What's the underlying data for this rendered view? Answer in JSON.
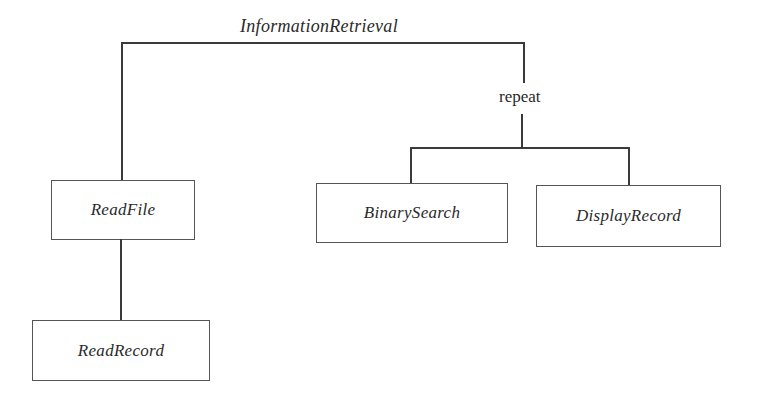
{
  "diagram": {
    "type": "structure-chart",
    "root": {
      "label": "InformationRetrieval",
      "children": [
        {
          "label": "ReadFile",
          "children": [
            {
              "label": "ReadRecord"
            }
          ]
        },
        {
          "construct": "repeat",
          "children": [
            {
              "label": "BinarySearch"
            },
            {
              "label": "DisplayRecord"
            }
          ]
        }
      ]
    },
    "nodes": {
      "root": "InformationRetrieval",
      "read_file": "ReadFile",
      "read_record": "ReadRecord",
      "repeat": "repeat",
      "binary_search": "BinarySearch",
      "display_record": "DisplayRecord"
    },
    "colors": {
      "line": "#3a3a3a",
      "box_border": "#555555",
      "text": "#2a2a2a",
      "background": "#ffffff"
    }
  }
}
